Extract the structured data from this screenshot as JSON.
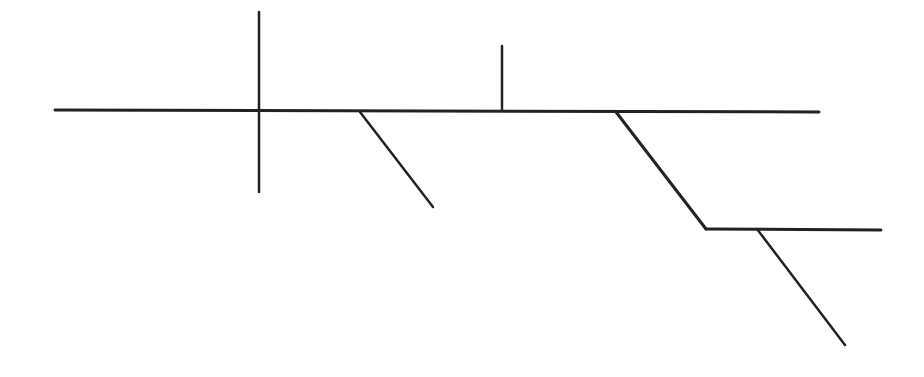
{
  "diagram": {
    "type": "sentence-diagram",
    "width": 924,
    "height": 377,
    "background": "#ffffff",
    "stroke_color": "#222222",
    "lines": [
      {
        "name": "baseline",
        "x1": 55,
        "y1": 110,
        "x2": 819,
        "y2": 112,
        "width": 3
      },
      {
        "name": "subject-predicate-divider",
        "x1": 259,
        "y1": 12,
        "x2": 259,
        "y2": 192,
        "width": 2.5
      },
      {
        "name": "object-divider",
        "x1": 502,
        "y1": 46,
        "x2": 502,
        "y2": 110,
        "width": 2.5
      },
      {
        "name": "modifier-slant-1",
        "x1": 360,
        "y1": 112,
        "x2": 433,
        "y2": 207,
        "width": 2.5
      },
      {
        "name": "modifier-slant-2",
        "x1": 616,
        "y1": 112,
        "x2": 706,
        "y2": 229,
        "width": 3
      },
      {
        "name": "prepositional-object-line",
        "x1": 706,
        "y1": 229,
        "x2": 881,
        "y2": 230,
        "width": 3
      },
      {
        "name": "modifier-slant-3",
        "x1": 757,
        "y1": 229,
        "x2": 845,
        "y2": 345,
        "width": 2.5
      }
    ]
  }
}
